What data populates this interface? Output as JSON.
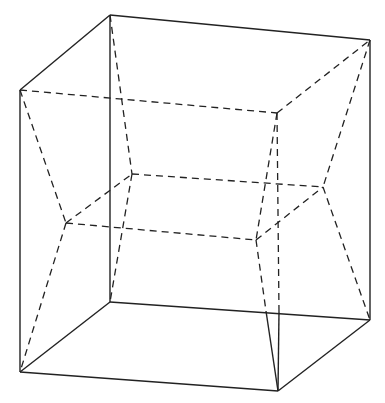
{
  "diagram": {
    "type": "wireframe-cube-hypercube-projection",
    "stroke_color": "#222222",
    "background": "#ffffff",
    "vertices": {
      "A": [
        110,
        15
      ],
      "B": [
        370,
        40
      ],
      "C": [
        20,
        90
      ],
      "D": [
        277,
        113
      ],
      "F": [
        132,
        174
      ],
      "E": [
        323,
        187
      ],
      "L": [
        66,
        223
      ],
      "R": [
        256,
        240
      ],
      "A2": [
        110,
        302
      ],
      "R2": [
        266,
        311
      ],
      "D2": [
        279,
        312
      ],
      "B2": [
        370,
        320
      ],
      "C2": [
        20,
        372
      ],
      "G2": [
        278,
        391
      ]
    },
    "solid_edges": [
      [
        "A",
        "B"
      ],
      [
        "A",
        "C"
      ],
      [
        "C",
        "C2"
      ],
      [
        "A",
        "A2"
      ],
      [
        "B",
        "B2"
      ],
      [
        "C2",
        "A2"
      ],
      [
        "A2",
        "B2"
      ],
      [
        "C2",
        "G2"
      ],
      [
        "G2",
        "B2"
      ],
      [
        "R2",
        "G2"
      ],
      [
        "D2",
        "G2"
      ]
    ],
    "dashed_edges": [
      [
        "C",
        "D"
      ],
      [
        "D",
        "B"
      ],
      [
        "F",
        "E"
      ],
      [
        "L",
        "R"
      ],
      [
        "L",
        "F"
      ],
      [
        "R",
        "E"
      ],
      [
        "A",
        "F"
      ],
      [
        "C",
        "L"
      ],
      [
        "D",
        "R"
      ],
      [
        "D",
        "D2"
      ],
      [
        "B",
        "E"
      ],
      [
        "E",
        "B2"
      ],
      [
        "L",
        "C2"
      ],
      [
        "F",
        "A2"
      ],
      [
        "R",
        "R2"
      ]
    ]
  }
}
